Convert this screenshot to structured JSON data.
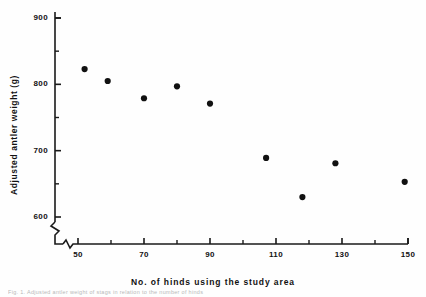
{
  "figure": {
    "caption_partial": "Fig. 1. Adjusted antler weight of stags in relation to the number of hinds"
  },
  "axes": {
    "y_title": "Adjusted antler weight  (g)",
    "x_title": "No.  of  hinds  using  the  study  area",
    "y_ticks": [
      "900",
      "800",
      "700",
      "600"
    ],
    "x_ticks": [
      "50",
      "70",
      "90",
      "110",
      "130",
      "150"
    ]
  },
  "chart_data": {
    "type": "scatter",
    "title": "",
    "xlabel": "No. of hinds using the study area",
    "ylabel": "Adjusted antler weight (g)",
    "xlim": [
      45,
      150
    ],
    "ylim": [
      570,
      900
    ],
    "grid": false,
    "legend": "none",
    "axis_break": {
      "x": true,
      "y": true
    },
    "x_major_ticks": [
      50,
      70,
      90,
      110,
      130,
      150
    ],
    "x_minor_ticks": [
      60,
      80,
      100,
      120,
      140
    ],
    "y_major_ticks": [
      600,
      700,
      800,
      900
    ],
    "y_minor_ticks": [
      650,
      750,
      850
    ],
    "marker": {
      "shape": "circle",
      "color": "#111111",
      "size": 5
    },
    "points": [
      {
        "x": 52,
        "y": 823
      },
      {
        "x": 59,
        "y": 805
      },
      {
        "x": 70,
        "y": 779
      },
      {
        "x": 80,
        "y": 797
      },
      {
        "x": 90,
        "y": 771
      },
      {
        "x": 107,
        "y": 689
      },
      {
        "x": 118,
        "y": 630
      },
      {
        "x": 128,
        "y": 681
      },
      {
        "x": 149,
        "y": 653
      }
    ]
  }
}
